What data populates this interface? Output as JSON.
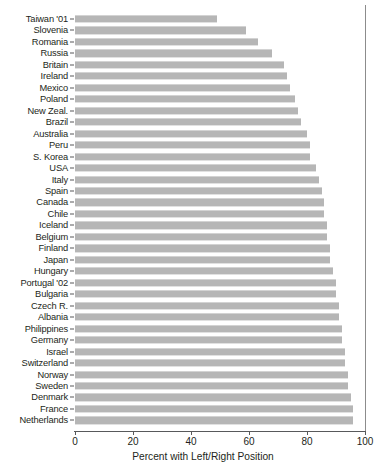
{
  "chart_data": {
    "type": "bar",
    "orientation": "horizontal",
    "title": "",
    "xlabel": "Percent with Left/Right Position",
    "ylabel": "",
    "xlim": [
      0,
      100
    ],
    "xticks": [
      0,
      20,
      40,
      60,
      80,
      100
    ],
    "xtick_labels": [
      "0",
      "20",
      "40",
      "60",
      "80",
      "100"
    ],
    "grid": false,
    "legend": null,
    "bar_color": "#b6b6b6",
    "axis_color": "#58595b",
    "text_color": "#231f20",
    "categories": [
      "Taiwan '01",
      "Slovenia",
      "Romania",
      "Russia",
      "Britain",
      "Ireland",
      "Mexico",
      "Poland",
      "New Zeal.",
      "Brazil",
      "Australia",
      "Peru",
      "S. Korea",
      "USA",
      "Italy",
      "Spain",
      "Canada",
      "Chile",
      "Iceland",
      "Belgium",
      "Finland",
      "Japan",
      "Hungary",
      "Portugal '02",
      "Bulgaria",
      "Czech R.",
      "Albania",
      "Philippines",
      "Germany",
      "Israel",
      "Switzerland",
      "Norway",
      "Sweden",
      "Denmark",
      "France",
      "Netherlands"
    ],
    "values": [
      49,
      59,
      63,
      68,
      72,
      73,
      74,
      76,
      77,
      78,
      80,
      81,
      81,
      83,
      84,
      85,
      86,
      86,
      87,
      87,
      88,
      88,
      89,
      90,
      90,
      91,
      91,
      92,
      92,
      93,
      93,
      94,
      94,
      95,
      96,
      96
    ]
  }
}
